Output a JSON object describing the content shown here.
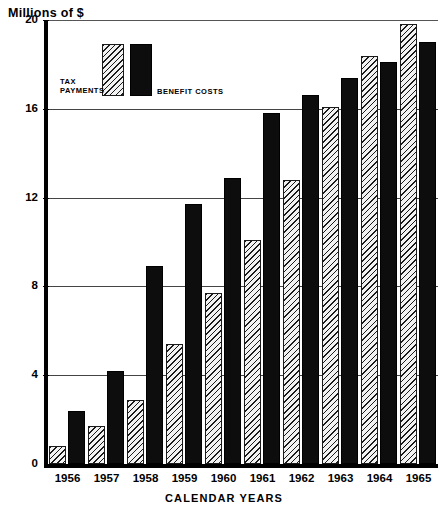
{
  "chart_data": {
    "type": "bar",
    "title": "Millions of $",
    "xlabel": "CALENDAR YEARS",
    "ylabel": "Millions of $",
    "ylim": [
      0,
      20
    ],
    "yticks": [
      0,
      4,
      8,
      12,
      16,
      20
    ],
    "ytick_labels": [
      "0",
      "4",
      "8",
      "12",
      "16",
      "20"
    ],
    "grid": true,
    "legend_position": "top-left",
    "categories": [
      "1956",
      "1957",
      "1958",
      "1959",
      "1960",
      "1961",
      "1962",
      "1963",
      "1964",
      "1965"
    ],
    "series": [
      {
        "name": "TAX PAYMENTS",
        "style": "hatched",
        "color": "#f2f2f2",
        "values": [
          0.8,
          1.7,
          2.9,
          5.4,
          7.7,
          10.1,
          12.8,
          16.1,
          18.4,
          19.8
        ]
      },
      {
        "name": "BENEFIT COSTS",
        "style": "solid",
        "color": "#0d0d0d",
        "values": [
          2.4,
          4.2,
          8.9,
          11.7,
          12.9,
          15.8,
          16.6,
          17.4,
          18.1,
          19.0
        ]
      }
    ]
  },
  "legend": {
    "tax_label_line1": "TAX",
    "tax_label_line2": "PAYMENTS",
    "benefit_label": "BENEFIT COSTS"
  }
}
